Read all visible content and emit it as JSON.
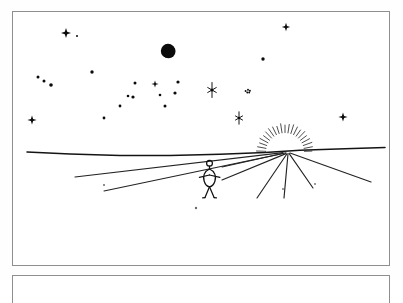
{
  "document": {
    "title": "Hand-drawn night-to-sunrise landscape sketch",
    "panel_label": "",
    "bottom_panel_label": ""
  },
  "canvas": {
    "width": 403,
    "height": 280,
    "background_color": "#ffffff",
    "ink_color": "#111111",
    "border_color": "#8f8f8f"
  },
  "frames": [
    {
      "name": "main-panel",
      "x": 12,
      "y": 11,
      "width": 378,
      "height": 255
    },
    {
      "name": "bottom-panel",
      "x": 12,
      "y": 275,
      "width": 378,
      "height": 28
    }
  ],
  "scene": {
    "description": "A stick figure stands on a plain at night, facing a rising sun on the horizon, under a sky full of stars with a dark moon.",
    "moon": {
      "label": "moon",
      "cx": 168,
      "cy": 51,
      "r": 7.2,
      "fill": "#0b0b0b",
      "crescent_cx": 172,
      "crescent_cy": 55,
      "crescent_r": 6.0
    },
    "sun": {
      "label": "rising-sun",
      "cx": 285,
      "cy": 152,
      "inner_r": 19,
      "outer_r": 28,
      "ray_count": 21,
      "start_angle_deg": 182,
      "end_angle_deg": 358,
      "color": "#3a3a3a"
    },
    "horizon": {
      "label": "horizon-line",
      "points": "27,152 70,154 120,155.5 170,155.6 220,154.3 265,152.5 300,150.3 345,148.8 385,147.6",
      "color": "#141414"
    },
    "perspective_rays": [
      {
        "name": "ray-left-upper",
        "x1": 75,
        "y1": 177,
        "x2": 283,
        "y2": 152.6
      },
      {
        "name": "ray-left-lower",
        "x1": 104,
        "y1": 191,
        "x2": 283,
        "y2": 153.5
      },
      {
        "name": "ray-right-1",
        "x1": 222,
        "y1": 167,
        "x2": 286,
        "y2": 152.8
      },
      {
        "name": "ray-right-2",
        "x1": 222,
        "y1": 180,
        "x2": 286,
        "y2": 153.6
      },
      {
        "name": "ray-right-3",
        "x1": 257,
        "y1": 198,
        "x2": 287,
        "y2": 153.8
      },
      {
        "name": "ray-right-4",
        "x1": 284,
        "y1": 198,
        "x2": 288,
        "y2": 153.8
      },
      {
        "name": "ray-right-5",
        "x1": 313,
        "y1": 188,
        "x2": 289,
        "y2": 153.4
      },
      {
        "name": "ray-right-6",
        "x1": 371,
        "y1": 182,
        "x2": 290,
        "y2": 153.0
      }
    ],
    "figure": {
      "label": "stick-figure-person",
      "head": {
        "cx": 209.5,
        "cy": 163.2,
        "r": 2.9
      },
      "neck": {
        "x1": 209.5,
        "y1": 166.1,
        "x2": 209.5,
        "y2": 169.0
      },
      "torso_path": "M209.5,169 C204.2,171.2 202.6,176.4 204.2,181.3 C205.4,185.1 207.6,186.6 209.5,186.8 C211.4,186.6 213.7,185.1 214.9,181.3 C216.5,176.4 214.9,171.2 209.5,169 Z",
      "arm_left": {
        "x1": 209.5,
        "y1": 175.0,
        "x2": 199.4,
        "y2": 177.4
      },
      "arm_right": {
        "x1": 209.5,
        "y1": 175.0,
        "x2": 219.9,
        "y2": 177.4
      },
      "leg_left": {
        "x1": 209.5,
        "y1": 186.8,
        "x2": 205.0,
        "y2": 197.6
      },
      "leg_right": {
        "x1": 209.5,
        "y1": 186.8,
        "x2": 214.1,
        "y2": 197.6
      },
      "foot_left": {
        "x1": 205.0,
        "y1": 197.6,
        "x2": 202.6,
        "y2": 197.8
      },
      "foot_right": {
        "x1": 214.1,
        "y1": 197.6,
        "x2": 216.5,
        "y2": 197.8
      }
    },
    "stars": [
      {
        "name": "star-cross-upper-left",
        "type": "cross4",
        "x": 66,
        "y": 33,
        "size": 5.0
      },
      {
        "name": "star-dot-a",
        "type": "dot",
        "x": 77,
        "y": 36,
        "size": 1.0
      },
      {
        "name": "star-cross-top-right",
        "type": "cross4",
        "x": 286,
        "y": 27,
        "size": 4.2
      },
      {
        "name": "star-dot-b",
        "type": "dot",
        "x": 263,
        "y": 59,
        "size": 1.7
      },
      {
        "name": "star-dot-c",
        "type": "dot",
        "x": 92,
        "y": 72,
        "size": 1.7
      },
      {
        "name": "star-dot-d",
        "type": "dot",
        "x": 38,
        "y": 77,
        "size": 1.5
      },
      {
        "name": "star-dot-e",
        "type": "dot",
        "x": 44,
        "y": 81,
        "size": 1.5
      },
      {
        "name": "star-dot-f",
        "type": "dot",
        "x": 51,
        "y": 85,
        "size": 1.8
      },
      {
        "name": "star-dot-g",
        "type": "dot",
        "x": 135,
        "y": 83,
        "size": 1.5
      },
      {
        "name": "star-cross-mid",
        "type": "cross4",
        "x": 155,
        "y": 84,
        "size": 3.6
      },
      {
        "name": "star-dot-h",
        "type": "dot",
        "x": 178,
        "y": 82,
        "size": 1.6
      },
      {
        "name": "star-dot-i",
        "type": "dot",
        "x": 160,
        "y": 95,
        "size": 1.3
      },
      {
        "name": "star-dot-j",
        "type": "dot",
        "x": 175,
        "y": 93,
        "size": 1.6
      },
      {
        "name": "star-dot-k",
        "type": "dot",
        "x": 128,
        "y": 96,
        "size": 1.3
      },
      {
        "name": "star-dot-l",
        "type": "dot",
        "x": 133,
        "y": 97,
        "size": 1.6
      },
      {
        "name": "star-dot-m",
        "type": "dot",
        "x": 120,
        "y": 106,
        "size": 1.4
      },
      {
        "name": "star-dot-n",
        "type": "dot",
        "x": 165,
        "y": 106,
        "size": 1.5
      },
      {
        "name": "star-dot-o",
        "type": "dot",
        "x": 104,
        "y": 118,
        "size": 1.4
      },
      {
        "name": "star-asterisk-left",
        "type": "star6",
        "x": 212,
        "y": 90,
        "size": 7.5
      },
      {
        "name": "star-cluster-small",
        "type": "cluster",
        "x": 248,
        "y": 91,
        "size": 2.4
      },
      {
        "name": "star-asterisk-lower",
        "type": "star6",
        "x": 239,
        "y": 118,
        "size": 6.2
      },
      {
        "name": "star-cross-far-left",
        "type": "cross4",
        "x": 32,
        "y": 120,
        "size": 4.6
      },
      {
        "name": "star-cross-far-right",
        "type": "cross4",
        "x": 343,
        "y": 117,
        "size": 4.6
      }
    ],
    "ground_marks": [
      {
        "name": "ground-speck-1",
        "x": 104,
        "y": 185,
        "size": 1.0
      },
      {
        "name": "ground-speck-2",
        "x": 196,
        "y": 208,
        "size": 1.2
      },
      {
        "name": "ground-speck-3",
        "x": 283,
        "y": 189,
        "size": 0.9
      },
      {
        "name": "ground-speck-4",
        "x": 315,
        "y": 184,
        "size": 0.9
      }
    ]
  }
}
